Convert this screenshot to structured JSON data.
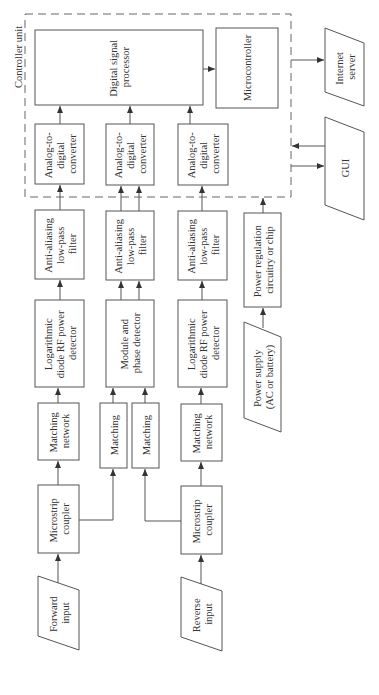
{
  "diagram": {
    "controller_unit_label": "Controller unit",
    "blocks": {
      "dsp": [
        "Digital signal",
        "processor"
      ],
      "microcontroller": [
        "Microcontroller"
      ],
      "internet_server": [
        "Internet",
        "server"
      ],
      "gui": [
        "GUI"
      ],
      "adc_1": [
        "Analog-to-",
        "digital",
        "converter"
      ],
      "adc_2": [
        "Analog-to-",
        "digital",
        "converter"
      ],
      "adc_3": [
        "Analog-to-",
        "digital",
        "converter"
      ],
      "filter_1": [
        "Anti-aliasing",
        "low-pass",
        "filter"
      ],
      "filter_2": [
        "Anti-aliasing",
        "low-pass",
        "filter"
      ],
      "filter_3": [
        "Anti-aliasing",
        "low-pass",
        "filter"
      ],
      "power_regulation": [
        "Power regulation",
        "circuitry or chip"
      ],
      "detector_1": [
        "Logarithmic",
        "diode RF power",
        "detector"
      ],
      "detector_2": [
        "Module and",
        "phase detector"
      ],
      "detector_3": [
        "Logarithmic",
        "diode RF power",
        "detector"
      ],
      "power_supply": [
        "Power supply",
        "(AC or battery)"
      ],
      "matching_network_1": [
        "Matching",
        "network"
      ],
      "matching_a": [
        "Matching"
      ],
      "matching_b": [
        "Matching"
      ],
      "matching_network_2": [
        "Matching",
        "network"
      ],
      "coupler_1": [
        "Microstrip",
        "coupler"
      ],
      "coupler_2": [
        "Microstrip",
        "coupler"
      ],
      "forward_input": [
        "Forward",
        "input"
      ],
      "reverse_input": [
        "Reverse",
        "input"
      ]
    },
    "colors": {
      "stroke": "#555555",
      "text": "#333333",
      "background": "#ffffff"
    }
  }
}
